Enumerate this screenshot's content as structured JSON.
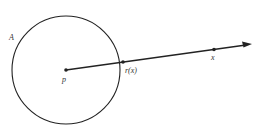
{
  "diagram": {
    "circle_label": "A",
    "center_label": "p",
    "intersection_label": "r(x)",
    "point_label": "x",
    "colors": {
      "stroke": "#222222",
      "background": "#ffffff"
    }
  }
}
